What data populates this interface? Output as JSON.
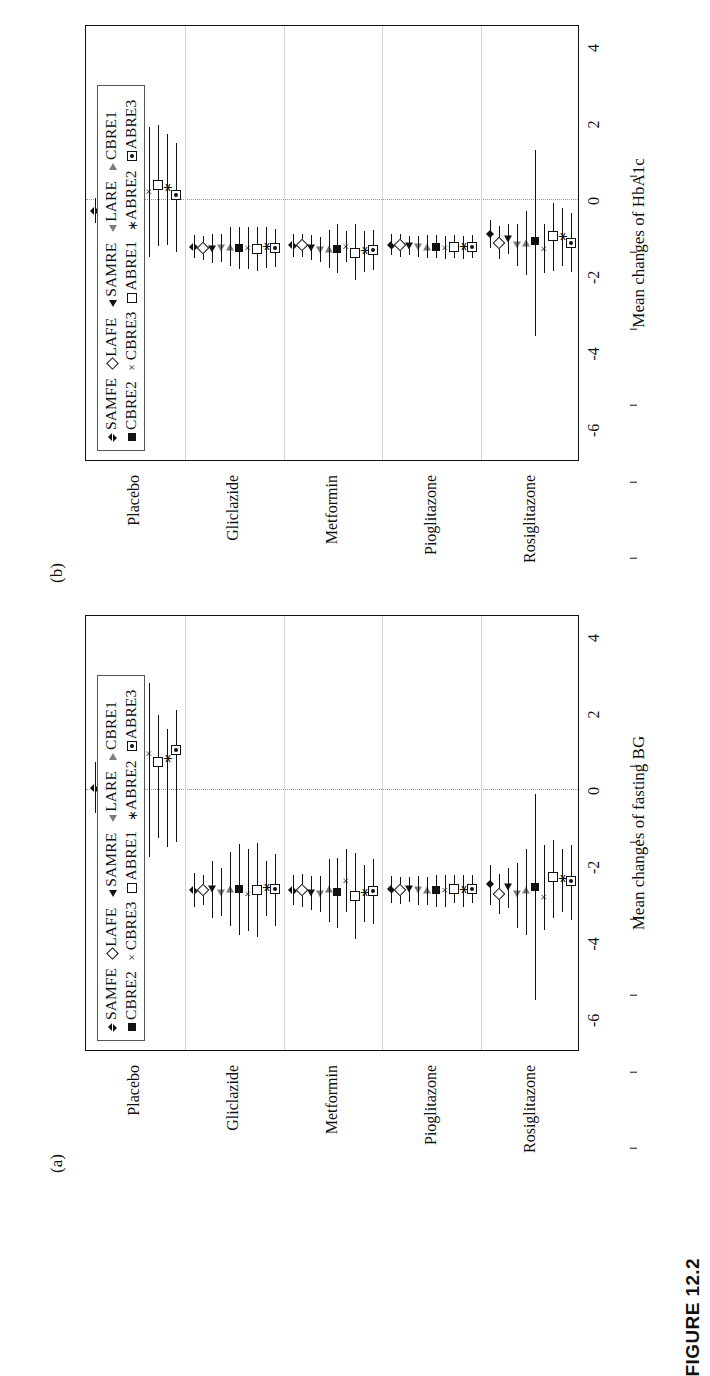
{
  "caption": "FIGURE 12.2",
  "legend": {
    "row1": [
      {
        "icon": "filled-diamond",
        "label": "SAMFE"
      },
      {
        "icon": "open-diamond",
        "label": "LAFE"
      },
      {
        "icon": "filled-triangle-left",
        "label": "SAMRE"
      },
      {
        "icon": "open-triangle-left",
        "label": "LARE"
      },
      {
        "icon": "open-triangle-right",
        "label": "CBRE1"
      }
    ],
    "row2": [
      {
        "icon": "filled-square",
        "label": "CBRE2"
      },
      {
        "icon": "times",
        "label": "CBRE3"
      },
      {
        "icon": "open-square",
        "label": "ABRE1"
      },
      {
        "icon": "asterisk",
        "label": "ABRE2"
      },
      {
        "icon": "square-dot",
        "label": "ABRE3"
      }
    ]
  },
  "panels": [
    {
      "tag": "(a)",
      "xlabel": "Mean changes of fasting BG",
      "xticks": [
        "-6",
        "-4",
        "-2",
        "0",
        "2",
        "4"
      ],
      "xlim": [
        -6.8,
        4.6
      ],
      "zero_ref": 0,
      "categories": [
        "Placebo",
        "Gliclazide",
        "Metformin",
        "Pioglitazone",
        "Rosiglitazone"
      ]
    },
    {
      "tag": "(b)",
      "xlabel": "Mean changes of HbA1c",
      "xticks": [
        "-6",
        "-4",
        "-2",
        "0",
        "2",
        "4"
      ],
      "xlim": [
        -6.8,
        4.6
      ],
      "zero_ref": 0,
      "categories": [
        "Placebo",
        "Gliclazide",
        "Metformin",
        "Pioglitazone",
        "Rosiglitazone"
      ]
    }
  ],
  "methods": [
    "SAMFE",
    "LAFE",
    "SAMRE",
    "LARE",
    "CBRE1",
    "CBRE2",
    "CBRE3",
    "ABRE1",
    "ABRE2",
    "ABRE3"
  ],
  "chart_data": {
    "type": "scatter",
    "title": "",
    "subtitle": "",
    "legend_position": "top-left inside axes",
    "grid": "category separators only",
    "panels": [
      {
        "name": "(a)",
        "xlabel": "Mean changes of fasting BG",
        "ylabel": "",
        "xlim": [
          -6.8,
          4.6
        ],
        "xticks": [
          -6,
          -4,
          -2,
          0,
          2,
          4
        ],
        "reference_line": 0,
        "groups": [
          {
            "category": "Placebo",
            "estimates": [
              0.05,
              -0.3,
              0.18,
              -0.22,
              0.52,
              0.45,
              0.95,
              0.72,
              0.8,
              1.05
            ],
            "lower": [
              -0.6,
              -1.45,
              -0.75,
              -1.3,
              -1.15,
              -1.4,
              -1.75,
              -1.25,
              -1.5,
              -1.35
            ],
            "upper": [
              0.72,
              0.65,
              1.05,
              0.85,
              2.2,
              1.5,
              2.8,
              1.95,
              1.6,
              2.1
            ]
          },
          {
            "category": "Gliclazide",
            "estimates": [
              -2.62,
              -2.62,
              -2.6,
              -2.7,
              -2.58,
              -2.6,
              -2.72,
              -2.62,
              -2.58,
              -2.6
            ],
            "lower": [
              -3.05,
              -3.0,
              -3.35,
              -3.3,
              -3.55,
              -3.8,
              -3.7,
              -3.85,
              -3.3,
              -3.55
            ],
            "upper": [
              -2.18,
              -2.22,
              -1.85,
              -2.05,
              -1.62,
              -1.42,
              -1.55,
              -1.4,
              -1.85,
              -1.68
            ]
          },
          {
            "category": "Metformin",
            "estimates": [
              -2.62,
              -2.62,
              -2.7,
              -2.72,
              -2.6,
              -2.68,
              -2.38,
              -2.78,
              -2.72,
              -2.65
            ],
            "lower": [
              -3.0,
              -3.05,
              -3.15,
              -3.2,
              -3.45,
              -3.6,
              -3.2,
              -3.9,
              -3.45,
              -3.5
            ],
            "upper": [
              -2.22,
              -2.2,
              -2.25,
              -2.25,
              -1.8,
              -1.78,
              -1.55,
              -1.65,
              -1.95,
              -1.8
            ]
          },
          {
            "category": "Pioglitazone",
            "estimates": [
              -2.6,
              -2.62,
              -2.6,
              -2.62,
              -2.62,
              -2.62,
              -2.62,
              -2.58,
              -2.62,
              -2.58
            ],
            "lower": [
              -2.95,
              -2.98,
              -2.92,
              -3.02,
              -3.0,
              -3.05,
              -3.05,
              -2.95,
              -3.05,
              -2.95
            ],
            "upper": [
              -2.25,
              -2.28,
              -2.28,
              -2.25,
              -2.28,
              -2.22,
              -2.22,
              -2.22,
              -2.22,
              -2.22
            ]
          },
          {
            "category": "Rosiglitazone",
            "estimates": [
              -2.45,
              -2.72,
              -2.55,
              -2.72,
              -2.62,
              -2.55,
              -2.8,
              -2.28,
              -2.35,
              -2.38
            ],
            "lower": [
              -3.0,
              -3.25,
              -3.1,
              -3.6,
              -3.8,
              -5.5,
              -3.65,
              -3.35,
              -3.2,
              -3.4
            ],
            "upper": [
              -1.95,
              -2.2,
              -2.05,
              -1.9,
              -1.55,
              -0.1,
              -1.45,
              -1.3,
              -1.55,
              -1.45
            ]
          }
        ]
      },
      {
        "name": "(b)",
        "xlabel": "Mean changes of HbA1c",
        "ylabel": "",
        "xlim": [
          -6.8,
          4.6
        ],
        "xticks": [
          -6,
          -4,
          -2,
          0,
          2,
          4
        ],
        "reference_line": 0,
        "groups": [
          {
            "category": "Placebo",
            "estimates": [
              -0.28,
              -0.35,
              -0.18,
              -0.42,
              -0.1,
              -0.12,
              0.22,
              0.38,
              0.3,
              0.12
            ],
            "lower": [
              -0.6,
              -1.05,
              -0.95,
              -1.0,
              -1.28,
              -1.45,
              -1.5,
              -1.2,
              -1.18,
              -1.35
            ],
            "upper": [
              0.05,
              0.3,
              0.6,
              0.18,
              1.05,
              1.25,
              1.9,
              1.95,
              1.72,
              1.48
            ]
          },
          {
            "category": "Gliclazide",
            "estimates": [
              -1.22,
              -1.25,
              -1.28,
              -1.25,
              -1.22,
              -1.25,
              -1.25,
              -1.28,
              -1.25,
              -1.25
            ],
            "lower": [
              -1.52,
              -1.58,
              -1.65,
              -1.62,
              -1.72,
              -1.8,
              -1.8,
              -1.85,
              -1.78,
              -1.75
            ],
            "upper": [
              -0.92,
              -0.95,
              -0.9,
              -0.9,
              -0.72,
              -0.7,
              -0.7,
              -0.72,
              -0.72,
              -0.75
            ]
          },
          {
            "category": "Metformin",
            "estimates": [
              -1.18,
              -1.18,
              -1.25,
              -1.3,
              -1.28,
              -1.28,
              -1.22,
              -1.38,
              -1.35,
              -1.3
            ],
            "lower": [
              -1.48,
              -1.5,
              -1.58,
              -1.62,
              -1.78,
              -1.92,
              -1.62,
              -2.1,
              -1.88,
              -1.82
            ],
            "upper": [
              -0.88,
              -0.88,
              -0.92,
              -0.98,
              -0.78,
              -0.62,
              -0.82,
              -0.62,
              -0.82,
              -0.78
            ]
          },
          {
            "category": "Pioglitazone",
            "estimates": [
              -1.18,
              -1.18,
              -1.2,
              -1.22,
              -1.22,
              -1.22,
              -1.25,
              -1.22,
              -1.25,
              -1.22
            ],
            "lower": [
              -1.45,
              -1.48,
              -1.45,
              -1.5,
              -1.52,
              -1.52,
              -1.55,
              -1.52,
              -1.55,
              -1.52
            ],
            "upper": [
              -0.9,
              -0.88,
              -0.95,
              -0.95,
              -0.92,
              -0.92,
              -0.95,
              -0.92,
              -0.95,
              -0.92
            ]
          },
          {
            "category": "Rosiglitazone",
            "estimates": [
              -0.88,
              -1.12,
              -1.02,
              -1.18,
              -1.12,
              -1.08,
              -1.28,
              -0.95,
              -0.98,
              -1.12
            ],
            "lower": [
              -1.25,
              -1.55,
              -1.42,
              -1.72,
              -1.95,
              -3.55,
              -1.92,
              -1.85,
              -1.72,
              -1.88
            ],
            "upper": [
              -0.52,
              -0.68,
              -0.62,
              -0.62,
              -0.28,
              1.3,
              -0.62,
              -0.08,
              -0.22,
              -0.35
            ]
          }
        ]
      }
    ]
  }
}
